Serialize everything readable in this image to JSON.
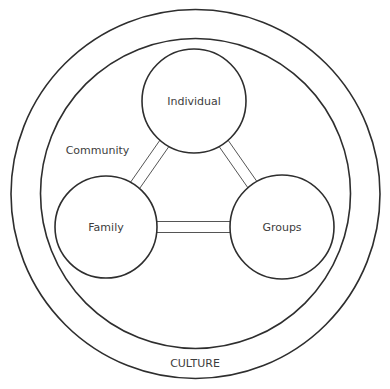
{
  "diagram": {
    "outer_label": "CULTURE",
    "inner_label": "Community",
    "nodes": [
      {
        "id": "individual",
        "label": "Individual"
      },
      {
        "id": "family",
        "label": "Family"
      },
      {
        "id": "groups",
        "label": "Groups"
      }
    ],
    "links": [
      {
        "from": "individual",
        "to": "family"
      },
      {
        "from": "individual",
        "to": "groups"
      },
      {
        "from": "family",
        "to": "groups"
      }
    ],
    "colors": {
      "stroke": "#2e2e2e",
      "text": "#3d3d3d",
      "background": "#ffffff"
    }
  }
}
